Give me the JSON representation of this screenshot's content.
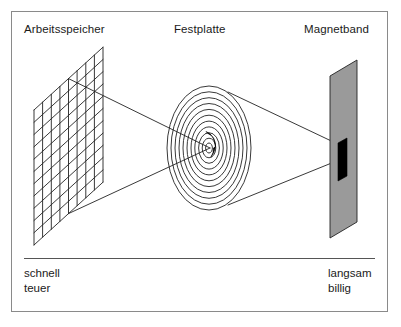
{
  "figure": {
    "title_labels": {
      "ram": "Arbeitsspeicher",
      "disk": "Festplatte",
      "tape": "Magnetband"
    },
    "footer": {
      "left_line1": "schnell",
      "left_line2": "teuer",
      "right_line1": "langsam",
      "right_line2": "billig"
    },
    "colors": {
      "frame_border": "#8a8a8a",
      "stroke": "#222222",
      "tape_fill": "#9a9a9a",
      "tape_block_fill": "#000000",
      "background": "#ffffff",
      "divider": "#555555"
    },
    "elements": {
      "ram_icon": "memory-grid-icon",
      "disk_icon": "hard-disk-spiral-icon",
      "tape_icon": "magnetic-tape-icon",
      "divider": "horizontal-divider"
    },
    "diagram_data": {
      "type": "storage-hierarchy",
      "stages": [
        {
          "name": "Arbeitsspeicher",
          "speed": "schnell",
          "cost": "teuer"
        },
        {
          "name": "Festplatte",
          "speed": "",
          "cost": ""
        },
        {
          "name": "Magnetband",
          "speed": "langsam",
          "cost": "billig"
        }
      ],
      "disk_ring_count": 11,
      "ram_grid_columns": 8,
      "ram_grid_rows": 11
    }
  }
}
